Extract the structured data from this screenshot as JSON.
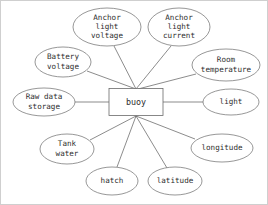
{
  "diagram": {
    "type": "entity-relationship",
    "title_visible": false,
    "background_color": "#ffffff",
    "line_color": "#5a5a5a",
    "text_color": "#2e2e2e",
    "entity": {
      "id": "buoy",
      "label": "buoy",
      "shape": "rectangle",
      "x": 135,
      "y": 101,
      "width": 54,
      "height": 27
    },
    "attributes": [
      {
        "id": "anchor-light-voltage",
        "lines": [
          "Anchor",
          "light",
          "voltage"
        ],
        "shape": "ellipse",
        "cx": 106,
        "cy": 26,
        "rx": 34,
        "ry": 19,
        "anchor_x": 113,
        "anchor_y": 45
      },
      {
        "id": "anchor-light-current",
        "lines": [
          "Anchor",
          "light",
          "current"
        ],
        "shape": "ellipse",
        "cx": 178,
        "cy": 26,
        "rx": 31,
        "ry": 19,
        "anchor_x": 170,
        "anchor_y": 45
      },
      {
        "id": "battery-voltage",
        "lines": [
          "Battery",
          "voltage"
        ],
        "shape": "ellipse",
        "cx": 62,
        "cy": 61,
        "rx": 28,
        "ry": 15,
        "anchor_x": 86,
        "anchor_y": 70
      },
      {
        "id": "room-temperature",
        "lines": [
          "Room",
          "temperature"
        ],
        "shape": "ellipse",
        "cx": 225,
        "cy": 64,
        "rx": 34,
        "ry": 16,
        "anchor_x": 195,
        "anchor_y": 73
      },
      {
        "id": "raw-data-storage",
        "lines": [
          "Raw data",
          "storage"
        ],
        "shape": "ellipse",
        "cx": 43,
        "cy": 101,
        "rx": 31,
        "ry": 14,
        "anchor_x": 74,
        "anchor_y": 101
      },
      {
        "id": "light",
        "lines": [
          "light"
        ],
        "shape": "ellipse",
        "cx": 230,
        "cy": 101,
        "rx": 28,
        "ry": 13,
        "anchor_x": 202,
        "anchor_y": 101
      },
      {
        "id": "tank-water",
        "lines": [
          "Tank",
          "water"
        ],
        "shape": "ellipse",
        "cx": 66,
        "cy": 148,
        "rx": 27,
        "ry": 15,
        "anchor_x": 89,
        "anchor_y": 139
      },
      {
        "id": "hatch",
        "lines": [
          "hatch"
        ],
        "shape": "ellipse",
        "cx": 111,
        "cy": 180,
        "rx": 26,
        "ry": 14,
        "anchor_x": 116,
        "anchor_y": 166
      },
      {
        "id": "latitude",
        "lines": [
          "latitude"
        ],
        "shape": "ellipse",
        "cx": 174,
        "cy": 180,
        "rx": 27,
        "ry": 14,
        "anchor_x": 166,
        "anchor_y": 167
      },
      {
        "id": "longitude",
        "lines": [
          "longitude"
        ],
        "shape": "ellipse",
        "cx": 221,
        "cy": 147,
        "rx": 31,
        "ry": 14,
        "anchor_x": 194,
        "anchor_y": 138
      }
    ],
    "edges": [
      {
        "from": "anchor-light-voltage",
        "to": "buoy",
        "x1": 113,
        "y1": 45,
        "x2": 135,
        "y2": 88
      },
      {
        "from": "anchor-light-current",
        "to": "buoy",
        "x1": 170,
        "y1": 45,
        "x2": 135,
        "y2": 88
      },
      {
        "from": "battery-voltage",
        "to": "buoy",
        "x1": 86,
        "y1": 70,
        "x2": 135,
        "y2": 88
      },
      {
        "from": "room-temperature",
        "to": "buoy",
        "x1": 195,
        "y1": 73,
        "x2": 137,
        "y2": 88
      },
      {
        "from": "raw-data-storage",
        "to": "buoy",
        "x1": 74,
        "y1": 101,
        "x2": 108,
        "y2": 101
      },
      {
        "from": "light",
        "to": "buoy",
        "x1": 202,
        "y1": 101,
        "x2": 162,
        "y2": 101
      },
      {
        "from": "tank-water",
        "to": "buoy",
        "x1": 89,
        "y1": 139,
        "x2": 135,
        "y2": 115
      },
      {
        "from": "hatch",
        "to": "buoy",
        "x1": 116,
        "y1": 166,
        "x2": 135,
        "y2": 115
      },
      {
        "from": "latitude",
        "to": "buoy",
        "x1": 166,
        "y1": 167,
        "x2": 135,
        "y2": 115
      },
      {
        "from": "longitude",
        "to": "buoy",
        "x1": 194,
        "y1": 138,
        "x2": 135,
        "y2": 115
      }
    ]
  }
}
